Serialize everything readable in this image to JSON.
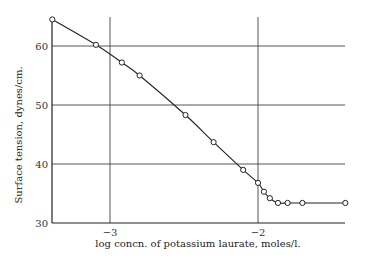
{
  "chart_data": {
    "type": "line",
    "title": "",
    "xlabel": "log concn. of potassium laurate, moles/l.",
    "ylabel": "Surface tension, dynes/cm.",
    "xlim": [
      -3.39,
      -1.41
    ],
    "ylim": [
      30,
      65
    ],
    "xticks": [
      {
        "value": -3,
        "label": "−3"
      },
      {
        "value": -2,
        "label": "−2"
      }
    ],
    "yticks": [
      {
        "value": 30,
        "label": "30"
      },
      {
        "value": 40,
        "label": "40"
      },
      {
        "value": 50,
        "label": "50"
      },
      {
        "value": 60,
        "label": "60"
      }
    ],
    "grid": true,
    "legend": null,
    "series": [
      {
        "name": "Potassium laurate",
        "marker": "open-circle",
        "x": [
          -3.39,
          -3.095,
          -2.92,
          -2.8,
          -2.49,
          -2.3,
          -2.1,
          -2.0,
          -1.96,
          -1.92,
          -1.865,
          -1.8,
          -1.7,
          -1.41
        ],
        "y": [
          64.5,
          60.2,
          57.2,
          55.0,
          48.3,
          43.7,
          39.0,
          36.8,
          35.3,
          34.2,
          33.4,
          33.4,
          33.4,
          33.4
        ]
      }
    ]
  },
  "style": {
    "line_color": "#222222",
    "grid_color": "#444444"
  }
}
